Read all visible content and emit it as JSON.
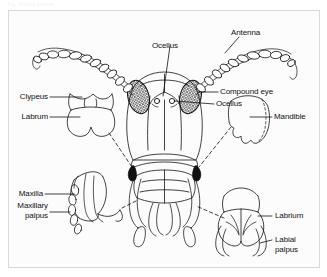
{
  "figure": {
    "header_caption": "Fig. Head of a beetle",
    "background_color": "#fcfcfc",
    "frame_color": "#d8d8d8",
    "ink_color": "#111111"
  },
  "labels": {
    "ocellus_top": "Ocellus",
    "antenna": "Antenna",
    "compound_eye": "Compound eye",
    "ocellus_right": "Ocellus",
    "mandible": "Mandible",
    "clypeus": "Clypeus",
    "labrum": "Labrum",
    "maxilla": "Maxilla",
    "maxillary_palpus_line1": "Maxillary",
    "maxillary_palpus_line2": "palpus",
    "labrium": "Labrium",
    "labial_palpus_line1": "Labial",
    "labial_palpus_line2": "palpus"
  },
  "parts": [
    {
      "id": "antenna-left",
      "name": "Antenna",
      "side": "left"
    },
    {
      "id": "antenna-right",
      "name": "Antenna",
      "side": "right"
    },
    {
      "id": "eye-left",
      "name": "Compound eye",
      "side": "left"
    },
    {
      "id": "eye-right",
      "name": "Compound eye",
      "side": "right"
    },
    {
      "id": "ocellus-left",
      "name": "Ocellus",
      "side": "left"
    },
    {
      "id": "ocellus-right",
      "name": "Ocellus",
      "side": "right"
    },
    {
      "id": "clypeus",
      "name": "Clypeus",
      "side": "inset-left"
    },
    {
      "id": "labrum",
      "name": "Labrum",
      "side": "inset-left"
    },
    {
      "id": "mandible",
      "name": "Mandible",
      "side": "inset-right"
    },
    {
      "id": "maxilla",
      "name": "Maxilla",
      "side": "inset-left"
    },
    {
      "id": "maxillary-palpus",
      "name": "Maxillary palpus",
      "side": "inset-left"
    },
    {
      "id": "labrium",
      "name": "Labrium",
      "side": "inset-right"
    },
    {
      "id": "labial-palpus",
      "name": "Labial palpus",
      "side": "inset-right"
    }
  ]
}
